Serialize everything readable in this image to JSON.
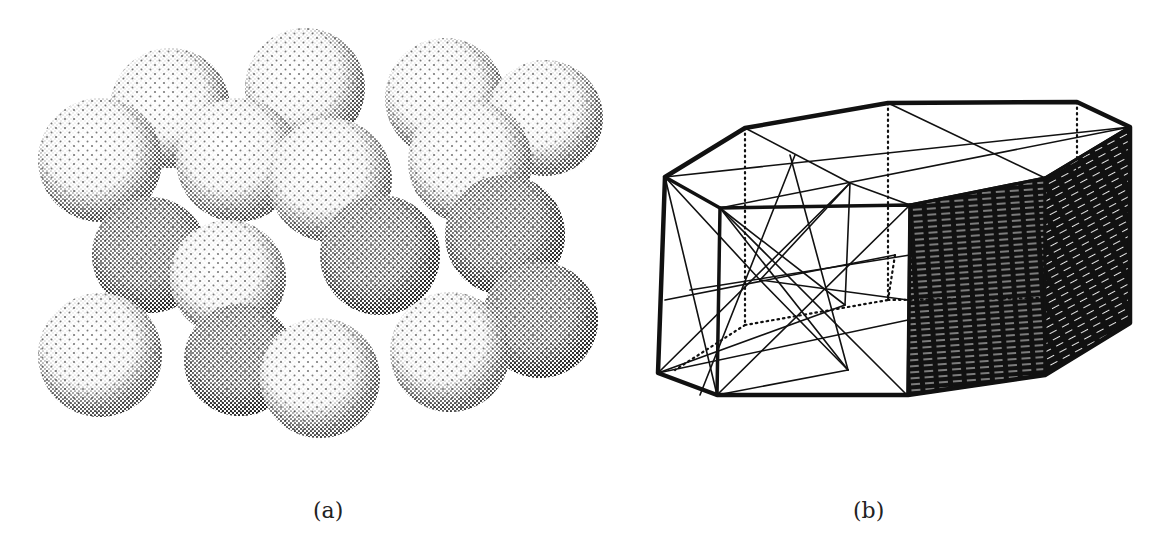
{
  "figure": {
    "panels": [
      {
        "id": "a",
        "label": "(a)",
        "description": "stippled close-packed spheres",
        "spheres": [
          {
            "cx": 170,
            "cy": 108,
            "r": 60,
            "shade": "light"
          },
          {
            "cx": 305,
            "cy": 88,
            "r": 60,
            "shade": "light"
          },
          {
            "cx": 445,
            "cy": 98,
            "r": 60,
            "shade": "light"
          },
          {
            "cx": 545,
            "cy": 118,
            "r": 58,
            "shade": "light"
          },
          {
            "cx": 100,
            "cy": 160,
            "r": 62,
            "shade": "light"
          },
          {
            "cx": 238,
            "cy": 160,
            "r": 62,
            "shade": "light"
          },
          {
            "cx": 330,
            "cy": 180,
            "r": 62,
            "shade": "light"
          },
          {
            "cx": 470,
            "cy": 162,
            "r": 62,
            "shade": "light"
          },
          {
            "cx": 150,
            "cy": 255,
            "r": 58,
            "shade": "dark"
          },
          {
            "cx": 380,
            "cy": 255,
            "r": 60,
            "shade": "dark"
          },
          {
            "cx": 505,
            "cy": 235,
            "r": 60,
            "shade": "dark"
          },
          {
            "cx": 228,
            "cy": 278,
            "r": 58,
            "shade": "light"
          },
          {
            "cx": 540,
            "cy": 320,
            "r": 58,
            "shade": "dark"
          },
          {
            "cx": 100,
            "cy": 355,
            "r": 62,
            "shade": "light"
          },
          {
            "cx": 240,
            "cy": 360,
            "r": 56,
            "shade": "dark"
          },
          {
            "cx": 320,
            "cy": 378,
            "r": 60,
            "shade": "light"
          },
          {
            "cx": 450,
            "cy": 352,
            "r": 60,
            "shade": "light"
          }
        ]
      },
      {
        "id": "b",
        "label": "(b)",
        "description": "crystal habit polyhedron with internal construction lines"
      }
    ]
  },
  "colors": {
    "ink": "#111111",
    "paper": "#ffffff"
  }
}
